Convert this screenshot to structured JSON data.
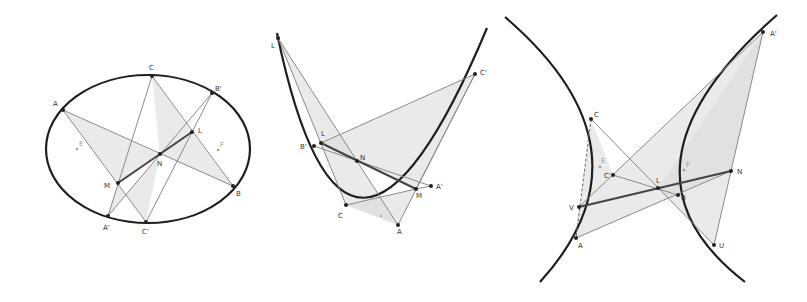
{
  "figures": {
    "ellipse": {
      "labels": {
        "A": "A",
        "C": "C",
        "B_prime": "B'",
        "L": "L",
        "E": "E",
        "F": "F",
        "N": "N",
        "M": "M",
        "B": "B",
        "A_prime": "A'",
        "C_prime": "C'"
      }
    },
    "parabola": {
      "labels": {
        "L_top": "L",
        "C_prime": "C'",
        "B_prime": "B'",
        "L": "L",
        "N": "N",
        "A_prime": "A'",
        "M": "M",
        "C": "C",
        "A": "A"
      }
    },
    "hyperbola": {
      "labels": {
        "A_prime": "A'",
        "C": "C",
        "E": "E",
        "D": "C'",
        "F": "F",
        "N": "N",
        "L": "L",
        "B": "B",
        "V": "V",
        "A": "A",
        "U": "U"
      }
    }
  }
}
